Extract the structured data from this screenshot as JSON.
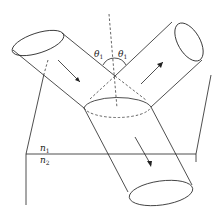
{
  "diagram": {
    "labels": {
      "theta_left": "θ",
      "theta_left_sub": "1",
      "theta_right": "θ",
      "theta_right_sub": "1",
      "n1": "n",
      "n1_sub": "1",
      "n2": "n",
      "n2_sub": "2"
    },
    "colors": {
      "stroke": "#222222",
      "background": "#ffffff"
    }
  }
}
